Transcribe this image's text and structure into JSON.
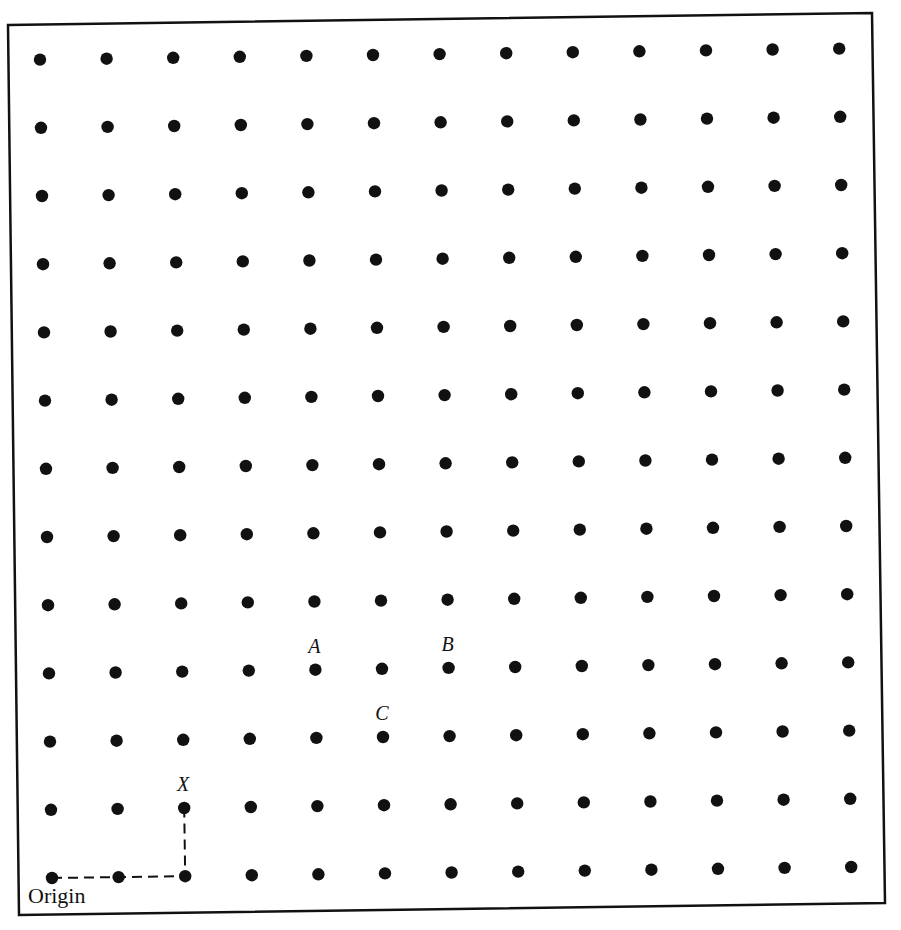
{
  "diagram": {
    "type": "lattice",
    "columns": 13,
    "rows": 13,
    "dot_color": "#111111",
    "frame_color": "#111111",
    "origin_label": "Origin",
    "point_labels": [
      {
        "label": "A",
        "col": 4,
        "row": 3
      },
      {
        "label": "B",
        "col": 6,
        "row": 3
      },
      {
        "label": "C",
        "col": 5,
        "row": 2
      },
      {
        "label": "X",
        "col": 2,
        "row": 1
      }
    ],
    "path": {
      "style": "dashed",
      "description": "Origin to X: two steps right, one step up",
      "points": [
        {
          "col": 0,
          "row": 0
        },
        {
          "col": 2,
          "row": 0
        },
        {
          "col": 2,
          "row": 1
        }
      ]
    }
  }
}
